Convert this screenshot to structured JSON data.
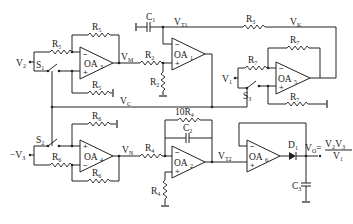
{
  "diagram": {
    "type": "circuit-schematic",
    "components": {
      "op_amps": [
        "OA1",
        "OA2",
        "OA3",
        "OA4",
        "OA5",
        "OA6"
      ],
      "resistors": [
        "R2",
        "R3",
        "R4",
        "R5",
        "R6",
        "R7",
        "R8",
        "10R4"
      ],
      "capacitors": [
        "C1",
        "C2",
        "C3"
      ],
      "switches": [
        "S1",
        "S2",
        "S3"
      ],
      "diodes": [
        "D1"
      ]
    },
    "labels": {
      "v2": "V",
      "v2_sub": "2",
      "neg_v3": "−V",
      "neg_v3_sub": "3",
      "v1": "V",
      "v1_sub": "1",
      "vm": "V",
      "vm_sub": "M",
      "vn": "V",
      "vn_sub": "N",
      "vc": "V",
      "vc_sub": "C",
      "vk": "V",
      "vk_sub": "K",
      "vt1": "V",
      "vt1_sub": "T1",
      "vt2": "V",
      "vt2_sub": "T2",
      "vo": "V",
      "vo_sub": "O",
      "vo_eq": "=",
      "vo_num": "V₂V₃",
      "vo_den": "V₁"
    },
    "op_amp_labels": {
      "oa1": "OA",
      "oa1_sub": "1",
      "oa2": "OA",
      "oa2_sub": "2",
      "oa3": "OA",
      "oa3_sub": "3",
      "oa4": "OA",
      "oa4_sub": "4",
      "oa5": "OA",
      "oa5_sub": "5",
      "oa6": "OA",
      "oa6_sub": "6"
    },
    "component_labels": {
      "r5_top": "R",
      "r5_top_sub": "5",
      "r5_in": "R",
      "r5_in_sub": "5",
      "r5_gnd": "R",
      "r5_gnd_sub": "5",
      "r2": "R",
      "r2_sub": "2",
      "r2_gnd": "R",
      "r2_gnd_sub": "2",
      "r3": "R",
      "r3_sub": "3",
      "r7_top": "R",
      "r7_top_sub": "7",
      "r7_in": "R",
      "r7_in_sub": "7",
      "r7_gnd": "R",
      "r7_gnd_sub": "7",
      "r6_top": "R",
      "r6_top_sub": "6",
      "r6_in": "R",
      "r6_in_sub": "6",
      "r6_fb": "R",
      "r6_fb_sub": "6",
      "r4": "R",
      "r4_sub": "4",
      "r4_gnd": "R",
      "r4_gnd_sub": "4",
      "r4_fb": "10R",
      "r4_fb_sub": "4",
      "c1": "C",
      "c1_sub": "1",
      "c2": "C",
      "c2_sub": "2",
      "c3": "C",
      "c3_sub": "3",
      "s1": "S",
      "s1_sub": "1",
      "s2": "S",
      "s2_sub": "2",
      "s3": "S",
      "s3_sub": "3",
      "d1": "D",
      "d1_sub": "1"
    },
    "signs": {
      "minus": "−",
      "plus": "+"
    }
  }
}
